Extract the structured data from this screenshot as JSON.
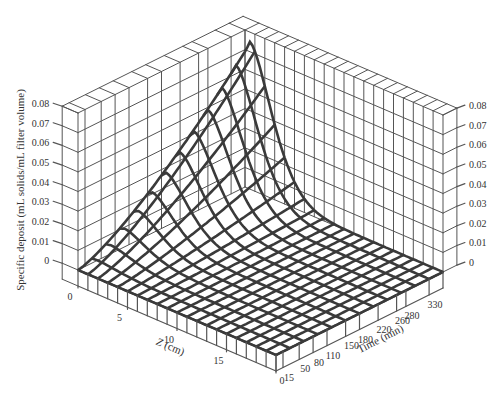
{
  "chart_data": {
    "type": "surface3d",
    "title": "",
    "zlabel": "Specific deposit (mL solids/mL filter volume)",
    "xlabel": "Z (cm)",
    "ylabel": "Time (min)",
    "x_axis": {
      "name": "Z (cm)",
      "ticks": [
        0,
        5,
        10,
        15
      ],
      "range": [
        0,
        20
      ]
    },
    "y_axis": {
      "name": "Time (min)",
      "ticks": [
        0,
        15,
        50,
        80,
        110,
        150,
        180,
        220,
        260,
        280,
        330
      ],
      "range": [
        0,
        360
      ]
    },
    "z_axis": {
      "name": "Specific deposit (mL solids/mL filter volume)",
      "ticks": [
        0,
        0.01,
        0.02,
        0.03,
        0.04,
        0.05,
        0.06,
        0.07,
        0.08
      ],
      "range": [
        0,
        0.08
      ]
    },
    "surface": {
      "description": "Deposit is highest near the filter inlet (Z≈0) and grows with time, reaching ~0.075 at Z≈0.5 cm, t≈360 min; it decays rapidly with depth, approaching ~0 beyond Z≈8 cm.",
      "z_grid_cm": [
        0,
        1,
        2,
        3,
        4,
        5,
        6,
        7,
        8,
        9,
        10,
        11,
        12,
        13,
        14,
        15,
        16,
        17,
        18,
        19,
        20
      ],
      "time_grid_min": [
        0,
        15,
        50,
        80,
        110,
        150,
        180,
        220,
        260,
        280,
        330,
        360
      ],
      "peak": {
        "z_cm": 0.5,
        "time_min": 360,
        "value": 0.075
      }
    },
    "grid": true,
    "legend": null
  },
  "labels": {
    "y_title": "Specific deposit (mL solids/mL filter volume)",
    "z_title": "Z (cm)",
    "t_title": "Time (min)"
  },
  "colors": {
    "surface": "#3a3a3a",
    "box": "#555555",
    "text": "#333333",
    "background": "#ffffff"
  }
}
